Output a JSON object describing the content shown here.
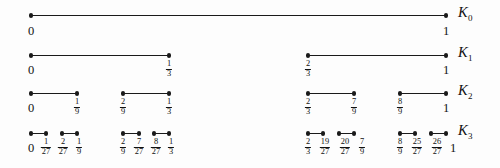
{
  "figure": {
    "background_color": "#fdfdfd",
    "line_color": "#1a1a1a",
    "text_color": "#111111",
    "axis": {
      "x_start_px": 31,
      "x_end_px": 446,
      "unit_span_px": 415
    }
  },
  "chart_data": {
    "type": "line",
    "xlabel": "",
    "ylabel": "",
    "xlim": [
      0,
      1
    ],
    "grid": false,
    "legend": "right",
    "series": [
      {
        "name": "K0",
        "label": "K",
        "subscript": "0",
        "row_y_px": 15,
        "intervals": [
          [
            0,
            1
          ]
        ],
        "tick_labels": [
          "0",
          "1"
        ],
        "tick_values": [
          0,
          1
        ]
      },
      {
        "name": "K1",
        "label": "K",
        "subscript": "1",
        "row_y_px": 55,
        "intervals": [
          [
            0,
            0.3333333333
          ],
          [
            0.6666666667,
            1
          ]
        ],
        "tick_labels": [
          "0",
          "1/3",
          "2/3",
          "1"
        ],
        "tick_values": [
          0,
          0.3333333333,
          0.6666666667,
          1
        ]
      },
      {
        "name": "K2",
        "label": "K",
        "subscript": "2",
        "row_y_px": 93,
        "intervals": [
          [
            0,
            0.1111111111
          ],
          [
            0.2222222222,
            0.3333333333
          ],
          [
            0.6666666667,
            0.7777777778
          ],
          [
            0.8888888889,
            1
          ]
        ],
        "tick_labels": [
          "0",
          "1/9",
          "2/9",
          "1/3",
          "2/3",
          "7/9",
          "8/9",
          "1"
        ],
        "tick_values": [
          0,
          0.1111111111,
          0.2222222222,
          0.3333333333,
          0.6666666667,
          0.7777777778,
          0.8888888889,
          1
        ]
      },
      {
        "name": "K3",
        "label": "K",
        "subscript": "3",
        "row_y_px": 133,
        "intervals": [
          [
            0,
            0.037037037
          ],
          [
            0.0740740741,
            0.1111111111
          ],
          [
            0.2222222222,
            0.2592592593
          ],
          [
            0.2962962963,
            0.3333333333
          ],
          [
            0.6666666667,
            0.7037037037
          ],
          [
            0.7407407407,
            0.7777777778
          ],
          [
            0.8888888889,
            0.9259259259
          ],
          [
            0.962962963,
            1
          ]
        ],
        "tick_labels": [
          "0",
          "1/27",
          "2/27",
          "1/9",
          "2/9",
          "7/27",
          "8/27",
          "1/3",
          "2/3",
          "19/27",
          "20/27",
          "7/9",
          "8/9",
          "25/27",
          "26/27",
          "1"
        ],
        "tick_values": [
          0,
          0.037037037,
          0.0740740741,
          0.1111111111,
          0.2222222222,
          0.2592592593,
          0.2962962963,
          0.3333333333,
          0.6666666667,
          0.7037037037,
          0.7407407407,
          0.7777777778,
          0.8888888889,
          0.9259259259,
          0.962962963,
          1
        ]
      }
    ]
  },
  "rows": [
    {
      "key": "k0",
      "label_text": "K",
      "label_sub": "0",
      "label_left_px": 458,
      "line_y_px": 15,
      "label_y_px": 4,
      "tick_y_px": 21,
      "segments": [
        {
          "x1": 31,
          "x2": 446
        }
      ],
      "ticks": [
        {
          "x": 31,
          "kind": "int",
          "text": "0"
        },
        {
          "x": 446,
          "kind": "int",
          "text": "1"
        }
      ]
    },
    {
      "key": "k1",
      "label_text": "K",
      "label_sub": "1",
      "label_left_px": 458,
      "line_y_px": 55,
      "label_y_px": 44,
      "tick_y_px": 60,
      "segments": [
        {
          "x1": 31,
          "x2": 169
        },
        {
          "x1": 308,
          "x2": 446
        }
      ],
      "ticks": [
        {
          "x": 31,
          "kind": "int",
          "text": "0"
        },
        {
          "x": 169,
          "kind": "frac",
          "num": "1",
          "den": "3"
        },
        {
          "x": 308,
          "kind": "frac",
          "num": "2",
          "den": "3"
        },
        {
          "x": 446,
          "kind": "int",
          "text": "1"
        }
      ]
    },
    {
      "key": "k2",
      "label_text": "K",
      "label_sub": "2",
      "label_left_px": 458,
      "line_y_px": 93,
      "label_y_px": 82,
      "tick_y_px": 98,
      "segments": [
        {
          "x1": 31,
          "x2": 77
        },
        {
          "x1": 123,
          "x2": 169
        },
        {
          "x1": 308,
          "x2": 354
        },
        {
          "x1": 400,
          "x2": 446
        }
      ],
      "ticks": [
        {
          "x": 31,
          "kind": "int",
          "text": "0"
        },
        {
          "x": 77,
          "kind": "frac",
          "num": "1",
          "den": "9"
        },
        {
          "x": 123,
          "kind": "frac",
          "num": "2",
          "den": "9"
        },
        {
          "x": 169,
          "kind": "frac",
          "num": "1",
          "den": "3"
        },
        {
          "x": 308,
          "kind": "frac",
          "num": "2",
          "den": "3"
        },
        {
          "x": 354,
          "kind": "frac",
          "num": "7",
          "den": "9"
        },
        {
          "x": 400,
          "kind": "frac",
          "num": "8",
          "den": "9"
        },
        {
          "x": 446,
          "kind": "int",
          "text": "1"
        }
      ]
    },
    {
      "key": "k3",
      "label_text": "K",
      "label_sub": "3",
      "label_left_px": 458,
      "line_y_px": 133,
      "label_y_px": 122,
      "tick_y_px": 138,
      "segments": [
        {
          "x1": 31,
          "x2": 46
        },
        {
          "x1": 62,
          "x2": 77
        },
        {
          "x1": 123,
          "x2": 139
        },
        {
          "x1": 154,
          "x2": 169
        },
        {
          "x1": 308,
          "x2": 323
        },
        {
          "x1": 339,
          "x2": 354
        },
        {
          "x1": 400,
          "x2": 415
        },
        {
          "x1": 431,
          "x2": 446
        }
      ],
      "ticks": [
        {
          "x": 31,
          "kind": "int",
          "text": "0"
        },
        {
          "x": 46,
          "kind": "frac",
          "num": "1",
          "den": "27"
        },
        {
          "x": 63,
          "kind": "frac",
          "num": "2",
          "den": "27"
        },
        {
          "x": 79,
          "kind": "frac",
          "num": "1",
          "den": "9"
        },
        {
          "x": 123,
          "kind": "frac",
          "num": "2",
          "den": "9"
        },
        {
          "x": 139,
          "kind": "frac",
          "num": "7",
          "den": "27"
        },
        {
          "x": 156,
          "kind": "frac",
          "num": "8",
          "den": "27"
        },
        {
          "x": 171,
          "kind": "frac",
          "num": "1",
          "den": "3"
        },
        {
          "x": 308,
          "kind": "frac",
          "num": "2",
          "den": "3"
        },
        {
          "x": 325,
          "kind": "frac",
          "num": "19",
          "den": "27"
        },
        {
          "x": 345,
          "kind": "frac",
          "num": "20",
          "den": "27"
        },
        {
          "x": 362,
          "kind": "frac",
          "num": "7",
          "den": "9"
        },
        {
          "x": 400,
          "kind": "frac",
          "num": "8",
          "den": "9"
        },
        {
          "x": 417,
          "kind": "frac",
          "num": "25",
          "den": "27"
        },
        {
          "x": 437,
          "kind": "frac",
          "num": "26",
          "den": "27"
        },
        {
          "x": 453,
          "kind": "int",
          "text": "1"
        }
      ]
    }
  ]
}
